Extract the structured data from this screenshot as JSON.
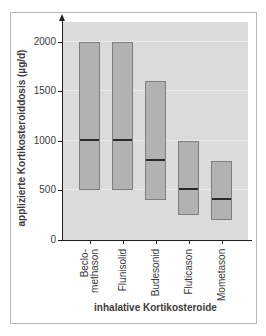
{
  "chart_data": {
    "type": "bar",
    "variant": "floating-range-bars-with-median-line",
    "title": "",
    "xlabel": "inhalative Kortikosteroide",
    "ylabel": "applizierte Kortikosteroiddosis (µg/d)",
    "categories": [
      "Beclo-\nmethason",
      "Flunisolid",
      "Budesonid",
      "Fluticason",
      "Mometason"
    ],
    "series": [
      {
        "name": "min",
        "values": [
          500,
          500,
          400,
          250,
          200
        ]
      },
      {
        "name": "max",
        "values": [
          2000,
          2000,
          1600,
          1000,
          800
        ]
      },
      {
        "name": "median",
        "values": [
          1000,
          1000,
          800,
          500,
          400
        ]
      }
    ],
    "yticks": [
      0,
      500,
      1000,
      1500,
      2000
    ],
    "ylim": [
      0,
      2200
    ],
    "grid": true,
    "legend": false
  },
  "colors": {
    "plot_bg": "#dbdbdb",
    "bar_fill": "#b2b2b2",
    "bar_border": "#7e7e7e",
    "median_line": "#2b2b2b",
    "gridline": "#ececec",
    "axis": "#1f1f1f",
    "text": "#3c3c3c",
    "frame_border": "#b8b8b8"
  }
}
